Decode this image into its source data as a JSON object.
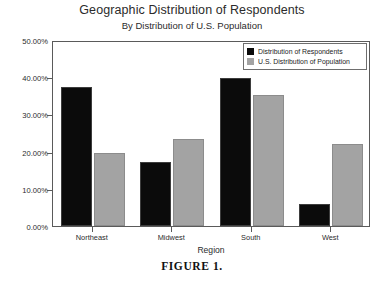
{
  "chart_data": {
    "type": "bar",
    "title": "Geographic Distribution of Respondents",
    "subtitle": "By Distribution of U.S. Population",
    "xlabel": "Region",
    "ylabel": "",
    "categories": [
      "Northeast",
      "Midwest",
      "South",
      "West"
    ],
    "series": [
      {
        "name": "Distribution of Respondents",
        "color": "#0b0b0b",
        "values": [
          37.5,
          17.2,
          39.8,
          6.0
        ]
      },
      {
        "name": "U.S. Distribution of Population",
        "color": "#a3a3a3",
        "values": [
          19.6,
          23.5,
          35.1,
          22.1
        ]
      }
    ],
    "ylim": [
      0,
      50
    ],
    "ytick_values": [
      50,
      40,
      30,
      20,
      10,
      0
    ],
    "ytick_labels": [
      "50.00%",
      "40.00%",
      "30.00%",
      "20.00%",
      "10.00%",
      "0.00%"
    ],
    "grid": false,
    "legend_position": "top-right",
    "value_format": "percent"
  },
  "caption": {
    "text": "FIGURE 1."
  }
}
